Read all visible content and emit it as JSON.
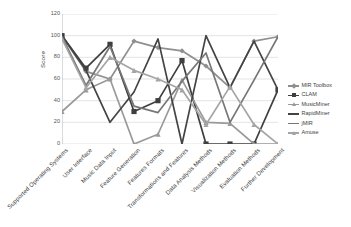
{
  "chart_data": {
    "type": "line",
    "title": "",
    "xlabel": "",
    "ylabel": "Score",
    "ylim": [
      0,
      120
    ],
    "ytick_step": 20,
    "yticks": [
      "0",
      "20",
      "40",
      "60",
      "80",
      "100",
      "120"
    ],
    "grid": true,
    "legend_position": "right",
    "categories": [
      "Supported Operating Systems",
      "User Interface",
      "Music Data Input",
      "Feature Generation",
      "Features Formats",
      "Transformations and Features",
      "Data Analysis Methods",
      "Visualization Methods",
      "Evaluation Methods",
      "Further Development"
    ],
    "series": [
      {
        "name": "MIR Toolbox",
        "color": "#8f8f8f",
        "marker": "diamond",
        "values": [
          100,
          67,
          60,
          95,
          89,
          86,
          72,
          52,
          95,
          99
        ]
      },
      {
        "name": "CLAM",
        "color": "#3f3f3f",
        "marker": "square",
        "values": [
          100,
          70,
          92,
          30,
          40,
          77,
          0,
          0,
          0,
          50
        ]
      },
      {
        "name": "MusicMiner",
        "color": "#9a9a9a",
        "marker": "triangle",
        "values": [
          30,
          50,
          60,
          0,
          9,
          59,
          20,
          19,
          0,
          0
        ]
      },
      {
        "name": "RapidMiner",
        "color": "#444444",
        "marker": "line",
        "values": [
          100,
          68,
          20,
          48,
          97,
          0,
          100,
          52,
          95,
          50
        ]
      },
      {
        "name": "jMIR",
        "color": "#777777",
        "marker": "line",
        "values": [
          99,
          54,
          90,
          35,
          29,
          58,
          84,
          20,
          59,
          99
        ]
      },
      {
        "name": "Amuse",
        "color": "#a5a5a5",
        "marker": "triangle",
        "values": [
          97,
          52,
          80,
          68,
          60,
          50,
          18,
          53,
          18,
          0
        ]
      }
    ]
  },
  "legend": {
    "items": [
      {
        "label": "MIR Toolbox"
      },
      {
        "label": "CLAM"
      },
      {
        "label": "MusicMiner"
      },
      {
        "label": "RapidMiner"
      },
      {
        "label": "jMIR"
      },
      {
        "label": "Amuse"
      }
    ]
  }
}
